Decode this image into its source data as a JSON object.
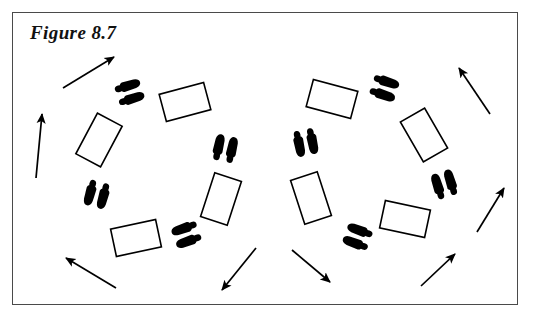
{
  "figure": {
    "caption": "Figure 8.7",
    "frame": {
      "x": 12,
      "y": 12,
      "width": 506,
      "height": 293,
      "stroke": "#4a4a4a",
      "stroke_width": 1.5
    },
    "background": "#ffffff",
    "ink_color": "#000000"
  },
  "diagram": {
    "type": "dance-step-floor-pattern",
    "rings": [
      {
        "name": "left-ring",
        "center_x": 162,
        "center_y": 168,
        "radius_x": 62,
        "radius_y": 72,
        "elements": [
          {
            "kind": "footprints",
            "name": "left-ring-footprints-top",
            "x": 130,
            "y": 92,
            "rotation": -18
          },
          {
            "kind": "rectangle",
            "name": "left-ring-rectangle-top-right",
            "x": 185,
            "y": 102,
            "rotation": -15,
            "width": 46,
            "height": 28
          },
          {
            "kind": "footprints",
            "name": "left-ring-footprints-right",
            "x": 225,
            "y": 148,
            "rotation": -78
          },
          {
            "kind": "rectangle",
            "name": "left-ring-rectangle-bottom-right",
            "x": 221,
            "y": 199,
            "rotation": -72,
            "width": 46,
            "height": 28
          },
          {
            "kind": "footprints",
            "name": "left-ring-footprints-bottom",
            "x": 186,
            "y": 235,
            "rotation": 160
          },
          {
            "kind": "rectangle",
            "name": "left-ring-rectangle-bottom-left",
            "x": 136,
            "y": 238,
            "rotation": 168,
            "width": 46,
            "height": 28
          },
          {
            "kind": "footprints",
            "name": "left-ring-footprints-left",
            "x": 97,
            "y": 195,
            "rotation": 105
          },
          {
            "kind": "rectangle",
            "name": "left-ring-rectangle-top-left",
            "x": 99,
            "y": 140,
            "rotation": 118,
            "width": 46,
            "height": 28
          }
        ]
      },
      {
        "name": "right-ring",
        "center_x": 373,
        "center_y": 168,
        "radius_x": 62,
        "radius_y": 72,
        "elements": [
          {
            "kind": "footprints",
            "name": "right-ring-footprints-top",
            "x": 385,
            "y": 88,
            "rotation": 18
          },
          {
            "kind": "rectangle",
            "name": "right-ring-rectangle-top-left",
            "x": 332,
            "y": 99,
            "rotation": 15,
            "width": 46,
            "height": 28
          },
          {
            "kind": "footprints",
            "name": "right-ring-footprints-left",
            "x": 306,
            "y": 143,
            "rotation": 78
          },
          {
            "kind": "rectangle",
            "name": "right-ring-rectangle-bottom-left",
            "x": 311,
            "y": 198,
            "rotation": 72,
            "width": 46,
            "height": 28
          },
          {
            "kind": "footprints",
            "name": "right-ring-footprints-bottom",
            "x": 357,
            "y": 237,
            "rotation": -160
          },
          {
            "kind": "rectangle",
            "name": "right-ring-rectangle-bottom-right",
            "x": 405,
            "y": 219,
            "rotation": -168,
            "width": 46,
            "height": 28
          },
          {
            "kind": "footprints",
            "name": "right-ring-footprints-right",
            "x": 444,
            "y": 184,
            "rotation": -108
          },
          {
            "kind": "rectangle",
            "name": "right-ring-rectangle-top-right",
            "x": 424,
            "y": 135,
            "rotation": -120,
            "width": 46,
            "height": 28
          }
        ]
      }
    ],
    "arrows": [
      {
        "name": "arrow-top-left",
        "x1": 63,
        "y1": 88,
        "x2": 114,
        "y2": 57
      },
      {
        "name": "arrow-left-up",
        "x1": 36,
        "y1": 178,
        "x2": 42,
        "y2": 114
      },
      {
        "name": "arrow-bottom-left",
        "x1": 116,
        "y1": 288,
        "x2": 66,
        "y2": 258
      },
      {
        "name": "arrow-bottom-mid-l",
        "x1": 256,
        "y1": 248,
        "x2": 222,
        "y2": 290
      },
      {
        "name": "arrow-bottom-mid-r",
        "x1": 292,
        "y1": 250,
        "x2": 330,
        "y2": 282
      },
      {
        "name": "arrow-bottom-right",
        "x1": 421,
        "y1": 286,
        "x2": 455,
        "y2": 254
      },
      {
        "name": "arrow-right-mid",
        "x1": 477,
        "y1": 232,
        "x2": 504,
        "y2": 188
      },
      {
        "name": "arrow-top-right",
        "x1": 490,
        "y1": 114,
        "x2": 459,
        "y2": 68
      }
    ]
  }
}
